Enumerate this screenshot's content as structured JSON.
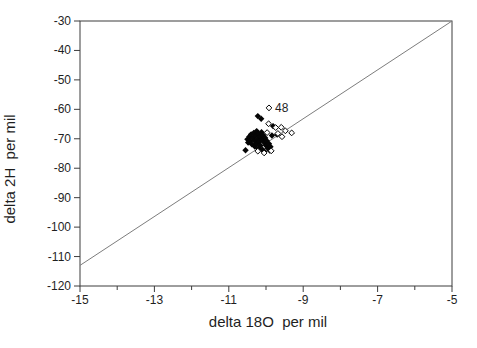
{
  "figure": {
    "background": "#ffffff",
    "frame_color": "#3d3d3d",
    "reference_line_color": "#7d7d7d",
    "marker_color": "#050505",
    "text_color": "#1f1f1f"
  },
  "chart_data": {
    "type": "scatter",
    "title": "",
    "xlabel": "delta 18O  per mil",
    "ylabel": "delta 2H  per mil",
    "xlim": [
      -15,
      -5
    ],
    "ylim": [
      -120,
      -30
    ],
    "x_major_ticks": [
      -15,
      -13,
      -11,
      -9,
      -7,
      -5
    ],
    "x_minor_ticks": [
      -14,
      -12,
      -10,
      -8,
      -6
    ],
    "y_major_ticks": [
      -30,
      -40,
      -50,
      -60,
      -70,
      -80,
      -90,
      -100,
      -110,
      -120
    ],
    "grid": false,
    "legend_position": "none",
    "reference_line": {
      "x1": -15,
      "y1": -113,
      "x2": -5,
      "y2": -30
    },
    "series": [
      {
        "name": "filled-diamond-samples",
        "marker": "filled-diamond",
        "points": [
          [
            -10.22,
            -62.3
          ],
          [
            -10.13,
            -63.2
          ],
          [
            -9.81,
            -65.7
          ],
          [
            -9.7,
            -68.6
          ],
          [
            -9.84,
            -68.9
          ],
          [
            -10.55,
            -73.9
          ],
          [
            -10.5,
            -70.2
          ],
          [
            -10.48,
            -71.3
          ],
          [
            -10.45,
            -69.3
          ],
          [
            -10.42,
            -70.7
          ],
          [
            -10.4,
            -68.5
          ],
          [
            -10.38,
            -71.9
          ],
          [
            -10.35,
            -69.7
          ],
          [
            -10.33,
            -68.0
          ],
          [
            -10.3,
            -70.8
          ],
          [
            -10.3,
            -72.6
          ],
          [
            -10.28,
            -69.0
          ],
          [
            -10.25,
            -67.4
          ],
          [
            -10.25,
            -71.7
          ],
          [
            -10.22,
            -70.1
          ],
          [
            -10.2,
            -68.3
          ],
          [
            -10.2,
            -73.3
          ],
          [
            -10.18,
            -71.0
          ],
          [
            -10.15,
            -69.2
          ],
          [
            -10.15,
            -72.3
          ],
          [
            -10.12,
            -67.8
          ],
          [
            -10.1,
            -70.3
          ],
          [
            -10.1,
            -73.6
          ],
          [
            -10.08,
            -68.7
          ],
          [
            -10.05,
            -71.3
          ],
          [
            -10.05,
            -74.3
          ],
          [
            -10.02,
            -69.7
          ],
          [
            -10.0,
            -72.3
          ],
          [
            -9.98,
            -70.7
          ],
          [
            -9.95,
            -73.2
          ],
          [
            -9.92,
            -71.7
          ],
          [
            -9.9,
            -74.0
          ],
          [
            -9.88,
            -72.7
          ]
        ]
      },
      {
        "name": "open-diamond-samples",
        "marker": "open-diamond",
        "points": [
          [
            -9.92,
            -59.5
          ],
          [
            -9.93,
            -64.9
          ],
          [
            -9.74,
            -66.2
          ],
          [
            -9.59,
            -66.1
          ],
          [
            -9.48,
            -67.3
          ],
          [
            -9.31,
            -68.0
          ],
          [
            -9.57,
            -69.3
          ],
          [
            -9.68,
            -68.2
          ],
          [
            -9.97,
            -67.9
          ],
          [
            -10.22,
            -74.2
          ],
          [
            -10.05,
            -74.8
          ],
          [
            -9.86,
            -74.1
          ]
        ]
      }
    ],
    "annotations": [
      {
        "text": "48",
        "x": -9.92,
        "y": -59.5
      }
    ]
  }
}
